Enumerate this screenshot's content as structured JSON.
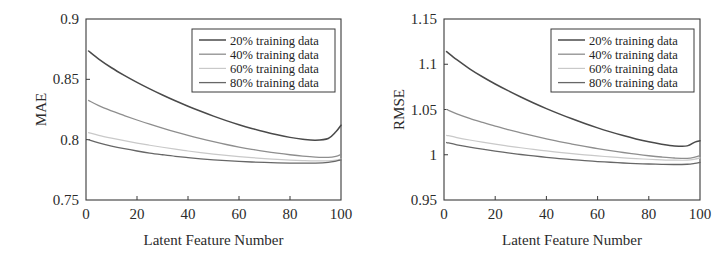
{
  "figure": {
    "background_color": "#ffffff",
    "frame_color": "#3a3a3a",
    "panel_count": 2
  },
  "chart_data": [
    {
      "type": "line",
      "panel": "left",
      "title": "",
      "xlabel": "Latent Feature Number",
      "ylabel": "MAE",
      "xlim": [
        0,
        100
      ],
      "ylim": [
        0.75,
        0.9
      ],
      "xticks": [
        0,
        20,
        40,
        60,
        80,
        100
      ],
      "xtick_labels": [
        "0",
        "20",
        "40",
        "60",
        "80",
        "100"
      ],
      "yticks": [
        0.75,
        0.8,
        0.85,
        0.9
      ],
      "ytick_labels": [
        "0.75",
        "0.8",
        "0.85",
        "0.9"
      ],
      "grid": false,
      "legend_position": "upper right",
      "x": [
        1,
        5,
        10,
        15,
        20,
        25,
        30,
        35,
        40,
        45,
        50,
        55,
        60,
        65,
        70,
        75,
        80,
        85,
        90,
        95,
        98,
        100
      ],
      "series": [
        {
          "name": "20% training data",
          "color": "#4a4a4a",
          "width": 1.5,
          "values": [
            0.8735,
            0.8668,
            0.8596,
            0.8533,
            0.8475,
            0.8421,
            0.837,
            0.8322,
            0.8277,
            0.8235,
            0.8195,
            0.8158,
            0.8124,
            0.8093,
            0.8065,
            0.804,
            0.8019,
            0.8004,
            0.7996,
            0.801,
            0.8065,
            0.812
          ]
        },
        {
          "name": "40% training data",
          "color": "#8e8e8e",
          "width": 1.3,
          "values": [
            0.8325,
            0.8282,
            0.8239,
            0.82,
            0.8163,
            0.8128,
            0.8095,
            0.8064,
            0.8035,
            0.8008,
            0.7983,
            0.796,
            0.7939,
            0.792,
            0.7903,
            0.7888,
            0.7875,
            0.7864,
            0.7856,
            0.7853,
            0.7862,
            0.7878
          ]
        },
        {
          "name": "60% training data",
          "color": "#c9c9c9",
          "width": 1.2,
          "values": [
            0.8058,
            0.8036,
            0.8013,
            0.7992,
            0.7972,
            0.7954,
            0.7937,
            0.7921,
            0.7906,
            0.7893,
            0.7881,
            0.787,
            0.786,
            0.7851,
            0.7843,
            0.7837,
            0.7831,
            0.7827,
            0.7824,
            0.7824,
            0.783,
            0.784
          ]
        },
        {
          "name": "80% training data",
          "color": "#676767",
          "width": 1.3,
          "values": [
            0.8,
            0.7973,
            0.7947,
            0.7925,
            0.7906,
            0.7889,
            0.7875,
            0.7862,
            0.7851,
            0.7841,
            0.7833,
            0.7826,
            0.782,
            0.7815,
            0.7811,
            0.7808,
            0.7806,
            0.7805,
            0.7806,
            0.7812,
            0.7822,
            0.7832
          ]
        }
      ]
    },
    {
      "type": "line",
      "panel": "right",
      "title": "",
      "xlabel": "Latent Feature Number",
      "ylabel": "RMSE",
      "xlim": [
        0,
        100
      ],
      "ylim": [
        0.95,
        1.15
      ],
      "xticks": [
        0,
        20,
        40,
        60,
        80,
        100
      ],
      "xtick_labels": [
        "0",
        "20",
        "40",
        "60",
        "80",
        "100"
      ],
      "yticks": [
        0.95,
        1.0,
        1.05,
        1.1,
        1.15
      ],
      "ytick_labels": [
        "0.95",
        "1",
        "1.05",
        "1.1",
        "1.15"
      ],
      "grid": false,
      "legend_position": "upper right",
      "x": [
        1,
        5,
        10,
        15,
        20,
        25,
        30,
        35,
        40,
        45,
        50,
        55,
        60,
        65,
        70,
        75,
        80,
        85,
        90,
        95,
        98,
        100
      ],
      "series": [
        {
          "name": "20% training data",
          "color": "#4a4a4a",
          "width": 1.5,
          "values": [
            1.114,
            1.105,
            1.095,
            1.0862,
            1.0782,
            1.0708,
            1.0638,
            1.0572,
            1.051,
            1.0452,
            1.0397,
            1.0345,
            1.0297,
            1.0253,
            1.0212,
            1.0175,
            1.0143,
            1.0117,
            1.0098,
            1.0098,
            1.014,
            1.0155
          ]
        },
        {
          "name": "40% training data",
          "color": "#8e8e8e",
          "width": 1.3,
          "values": [
            1.05,
            1.0452,
            1.0402,
            1.0358,
            1.0316,
            1.0278,
            1.0242,
            1.0208,
            1.0176,
            1.0146,
            1.0118,
            1.0092,
            1.0068,
            1.0046,
            1.0025,
            1.0006,
            0.9989,
            0.9975,
            0.9964,
            0.996,
            0.9973,
            0.999
          ]
        },
        {
          "name": "60% training data",
          "color": "#c9c9c9",
          "width": 1.2,
          "values": [
            1.0215,
            1.019,
            1.0163,
            1.0139,
            1.0117,
            1.0096,
            1.0077,
            1.0059,
            1.0042,
            1.0026,
            1.0012,
            0.9999,
            0.9987,
            0.9976,
            0.9966,
            0.9957,
            0.995,
            0.9944,
            0.994,
            0.994,
            0.9951,
            0.9965
          ]
        },
        {
          "name": "80% training data",
          "color": "#676767",
          "width": 1.3,
          "values": [
            1.0135,
            1.011,
            1.0084,
            1.0061,
            1.004,
            1.0021,
            1.0003,
            0.9987,
            0.9972,
            0.9958,
            0.9946,
            0.9935,
            0.9925,
            0.9917,
            0.9909,
            0.9903,
            0.9898,
            0.9894,
            0.9892,
            0.9895,
            0.9905,
            0.9915
          ]
        }
      ]
    }
  ]
}
